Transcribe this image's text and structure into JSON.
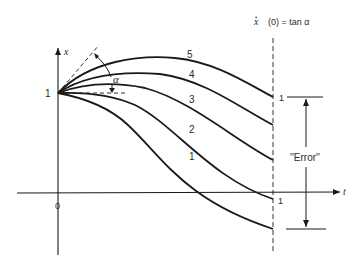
{
  "diagram": {
    "title_formula": {
      "variable": "x",
      "rest": "(0) = tan α",
      "dot": "•"
    },
    "axes": {
      "y_label": "x",
      "x_label": "t",
      "origin_label": "0",
      "y_start_label": "1"
    },
    "curves": [
      {
        "id": "1",
        "label": "1"
      },
      {
        "id": "2",
        "label": "2"
      },
      {
        "id": "3",
        "label": "3"
      },
      {
        "id": "4",
        "label": "4"
      },
      {
        "id": "5",
        "label": "5"
      }
    ],
    "angle_label": "α",
    "target_marks": {
      "upper": "1",
      "lower": "1"
    },
    "error_label": "''Error''",
    "colors": {
      "stroke": "#1a1a1a",
      "text": "#2a2a2a",
      "background": "#ffffff"
    }
  }
}
